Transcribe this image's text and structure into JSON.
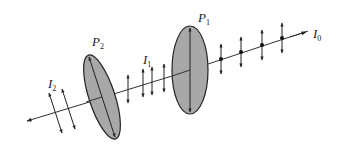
{
  "diagram": {
    "type": "polarization-through-two-polarizers",
    "labels": {
      "I0": {
        "main": "I",
        "sub": "0"
      },
      "I1": {
        "main": "I",
        "sub": "1"
      },
      "I2": {
        "main": "I",
        "sub": "2"
      },
      "P1": {
        "main": "P",
        "sub": "1"
      },
      "P2": {
        "main": "P",
        "sub": "2"
      }
    },
    "colors": {
      "line": "#333333",
      "polarizer_fill": "#a8a8a8",
      "polarizer_stroke": "#222222",
      "background": "#ffffff"
    },
    "stages": [
      {
        "name": "incident",
        "label": "I0",
        "polarization": "unpolarized (dots + vertical arrows)",
        "markers": 4
      },
      {
        "name": "after P1",
        "label": "I1",
        "polarization": "vertical linear",
        "markers": 4
      },
      {
        "name": "after P2",
        "label": "I2",
        "polarization": "tilted linear",
        "markers": 2
      }
    ],
    "polarizers": [
      {
        "label": "P1",
        "axis": "vertical"
      },
      {
        "label": "P2",
        "axis": "tilted"
      }
    ]
  }
}
